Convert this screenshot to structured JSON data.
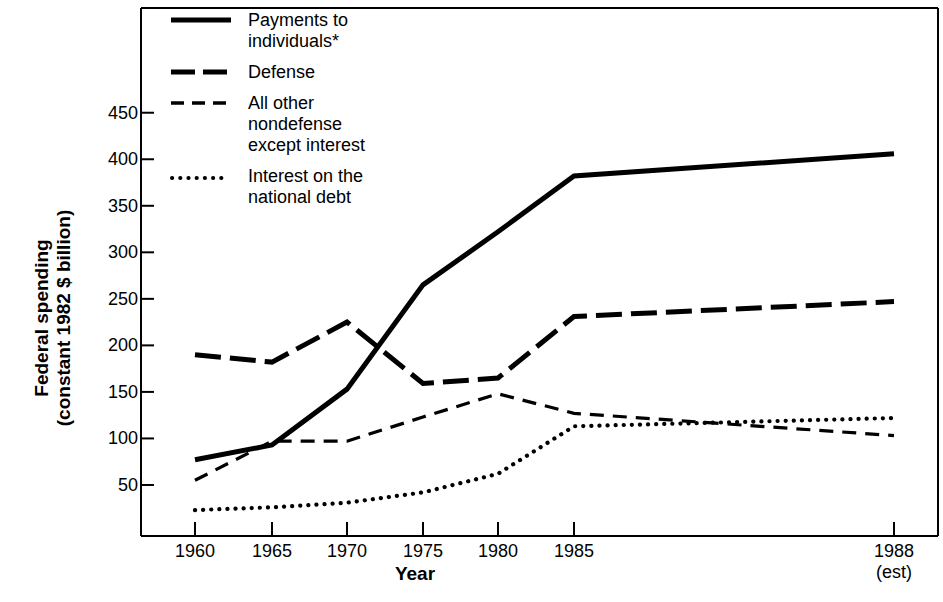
{
  "chart_data": {
    "type": "line",
    "title": "",
    "xlabel": "Year",
    "ylabel": "Federal spending\n(constant 1982 $ billion)",
    "x": [
      1960,
      1965,
      1970,
      1975,
      1980,
      1985,
      1988
    ],
    "xtick_labels": [
      "1960",
      "1965",
      "1970",
      "1975",
      "1980",
      "1985",
      "1988"
    ],
    "xtick_sublabel_last": "(est)",
    "ytick_labels": [
      "50",
      "100",
      "150",
      "200",
      "250",
      "300",
      "350",
      "400",
      "450"
    ],
    "ytick_values": [
      50,
      100,
      150,
      200,
      250,
      300,
      350,
      400,
      450
    ],
    "ylim": [
      0,
      480
    ],
    "xlim": [
      1957.5,
      1990.5
    ],
    "grid": false,
    "legend_position": "top-left-inside",
    "footnote_marker": "*",
    "series": [
      {
        "name": "Payments to\nindividuals*",
        "legend_label": "Payments to\nindividuals*",
        "style": "solid",
        "values": [
          77,
          93,
          153,
          265,
          322,
          382,
          406
        ]
      },
      {
        "name": "Defense",
        "legend_label": "Defense",
        "style": "long-dash",
        "values": [
          190,
          182,
          225,
          159,
          165,
          231,
          247
        ]
      },
      {
        "name": "All other\nnondefense\nexcept interest",
        "legend_label": "All other\nnondefense\nexcept interest",
        "style": "short-dash",
        "values": [
          55,
          97,
          97,
          123,
          148,
          127,
          103
        ]
      },
      {
        "name": "Interest on the\nnational debt",
        "legend_label": "Interest on the\nnational debt",
        "style": "dotted",
        "values": [
          23,
          26,
          31,
          42,
          62,
          113,
          122
        ]
      }
    ]
  },
  "colors": {
    "ink": "#000000",
    "background": "#ffffff"
  }
}
